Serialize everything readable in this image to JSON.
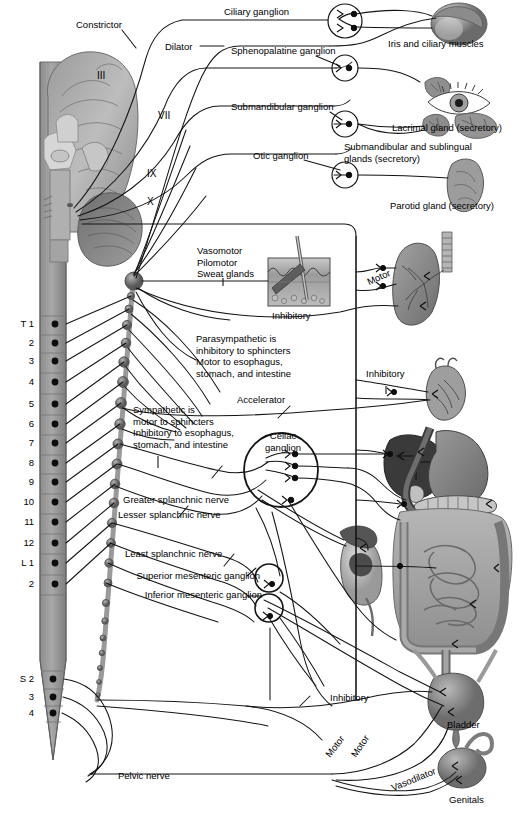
{
  "figure": {
    "background": "#ffffff",
    "line_color": "#1a1a1a"
  },
  "cranial_nerves": [
    {
      "id": "III",
      "label": "III"
    },
    {
      "id": "VII",
      "label": "VII"
    },
    {
      "id": "IX",
      "label": "IX"
    },
    {
      "id": "X",
      "label": "X"
    }
  ],
  "pupil_labels": {
    "constrictor": "Constrictor",
    "dilator": "Dilator"
  },
  "ganglia": [
    {
      "name": "ciliary",
      "label": "Ciliary ganglion"
    },
    {
      "name": "sphenopalatine",
      "label": "Sphenopalatine ganglion"
    },
    {
      "name": "submandibular",
      "label": "Submandibular ganglion"
    },
    {
      "name": "otic",
      "label": "Otic ganglion"
    },
    {
      "name": "celiac",
      "label": "Celiac\nganglion"
    },
    {
      "name": "superior-mesenteric",
      "label": "Superior mesenteric ganglion"
    },
    {
      "name": "inferior-mesenteric",
      "label": "Inferior mesenteric ganglion"
    }
  ],
  "organs": [
    {
      "name": "iris-ciliary",
      "label": "Iris and ciliary muscles"
    },
    {
      "name": "lacrimal-gland",
      "label": "Lacrimal gland (secretory)"
    },
    {
      "name": "submandibular-sublingual",
      "label": "Submandibular and sublingual\nglands (secretory)"
    },
    {
      "name": "parotid-gland",
      "label": "Parotid gland (secretory)"
    },
    {
      "name": "skin",
      "label": ""
    },
    {
      "name": "lung",
      "label": ""
    },
    {
      "name": "heart",
      "label": ""
    },
    {
      "name": "liver",
      "label": ""
    },
    {
      "name": "stomach",
      "label": ""
    },
    {
      "name": "pancreas",
      "label": ""
    },
    {
      "name": "kidney",
      "label": ""
    },
    {
      "name": "intestine",
      "label": ""
    },
    {
      "name": "bladder",
      "label": "Bladder"
    },
    {
      "name": "genitals",
      "label": "Genitals"
    }
  ],
  "effector_notes": {
    "vasomotor_block": "Vasomotor\nPilomotor\nSweat glands",
    "parasympathetic_block": "Parasympathetic is\ninhibitory to sphincters\nMotor to esophagus,\nstomach, and intestine",
    "sympathetic_block": "Sympathetic is\nmotor to sphincters\nInhibitory to esophagus,\nstomach, and intestine"
  },
  "fiber_labels": {
    "lung_motor": "Motor",
    "lung_inhibitory": "Inhibitory",
    "heart_inhibitory": "Inhibitory",
    "heart_accelerator": "Accelerator",
    "bladder_inhibitory": "Inhibitory",
    "bladder_motor": "Motor",
    "genitals_motor": "Motor",
    "genitals_vasodilator": "Vasodilator"
  },
  "splanchnic_nerves": [
    {
      "name": "greater",
      "label": "Greater splanchnic nerve"
    },
    {
      "name": "lesser",
      "label": "Lesser splanchnic nerve"
    },
    {
      "name": "least",
      "label": "Least splanchnic nerve"
    }
  ],
  "pelvic_nerve": {
    "label": "Pelvic nerve"
  },
  "spinal_segments": {
    "thoracic": [
      {
        "label": "T 1",
        "y": 324
      },
      {
        "label": "2",
        "y": 343
      },
      {
        "label": "3",
        "y": 361
      },
      {
        "label": "4",
        "y": 382
      },
      {
        "label": "5",
        "y": 404
      },
      {
        "label": "6",
        "y": 424
      },
      {
        "label": "7",
        "y": 443
      },
      {
        "label": "8",
        "y": 463
      },
      {
        "label": "9",
        "y": 482
      },
      {
        "label": "10",
        "y": 502
      },
      {
        "label": "11",
        "y": 522
      },
      {
        "label": "12",
        "y": 543
      },
      {
        "label": "L 1",
        "y": 563
      },
      {
        "label": "2",
        "y": 584
      }
    ],
    "sacral": [
      {
        "label": "S 2",
        "y": 679
      },
      {
        "label": "3",
        "y": 697
      },
      {
        "label": "4",
        "y": 713
      }
    ]
  }
}
